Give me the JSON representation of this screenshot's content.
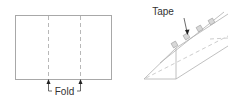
{
  "diagram": {
    "left_panel": {
      "title": "flat sheet with fold lines",
      "fold_label": "Fold",
      "fold_line_count": 2
    },
    "right_panel": {
      "title": "folded triangular prism",
      "tape_label": "Tape",
      "tape_piece_count": 4
    },
    "colors": {
      "line": "#9a9a9a",
      "dashed": "#b0b0b0",
      "text": "#333333",
      "tape_fill": "#d8d8d8",
      "arrow": "#222222"
    }
  }
}
